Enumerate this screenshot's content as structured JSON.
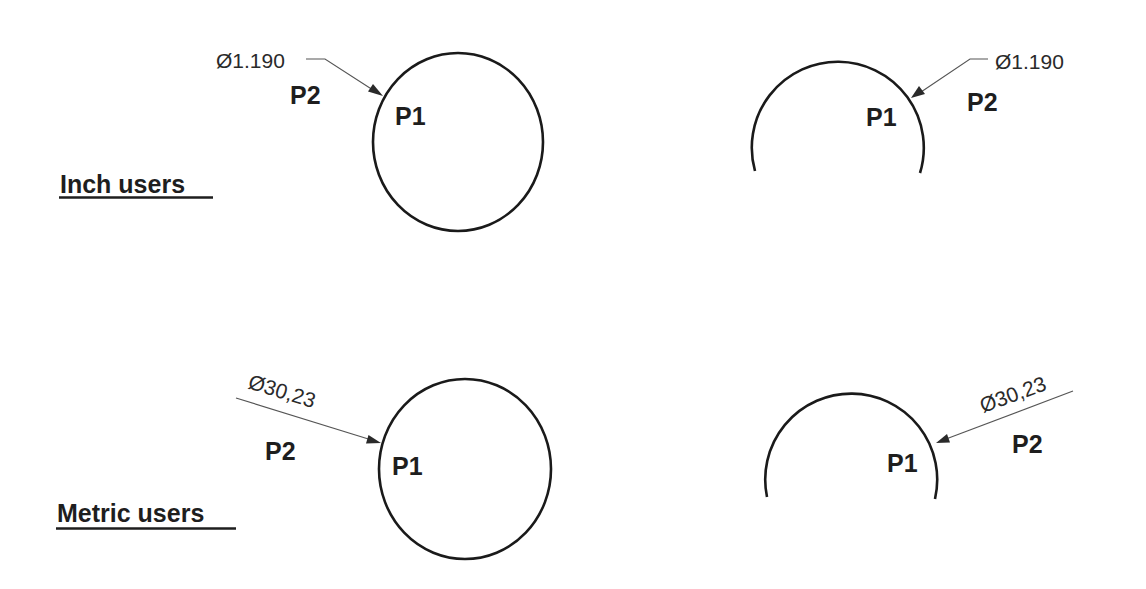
{
  "sections": {
    "inch": {
      "label": "Inch users",
      "circle_example": {
        "dimension": "Ø1.190",
        "p1": "P1",
        "p2": "P2"
      },
      "arc_example": {
        "dimension": "Ø1.190",
        "p1": "P1",
        "p2": "P2"
      }
    },
    "metric": {
      "label": "Metric users",
      "circle_example": {
        "dimension": "Ø30,23",
        "p1": "P1",
        "p2": "P2"
      },
      "arc_example": {
        "dimension": "Ø30,23",
        "p1": "P1",
        "p2": "P2"
      }
    }
  },
  "colors": {
    "background": "#ffffff",
    "geometry": "#1a1a1a",
    "leader": "#555555",
    "text": "#1e1e1e"
  }
}
